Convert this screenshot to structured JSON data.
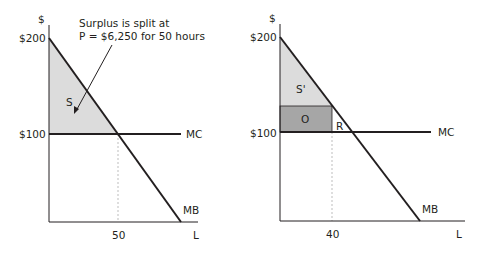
{
  "colors": {
    "axis": "#231f20",
    "curve": "#231f20",
    "light_fill": "#dcdcdc",
    "dark_fill": "#a6a6a6",
    "guide": "#bdbdbd"
  },
  "left_panel": {
    "y_axis_label": "$",
    "y_ticks": [
      "$200",
      "$100"
    ],
    "x_tick": "50",
    "x_axis_label": "L",
    "mc_label": "MC",
    "mb_label": "MB",
    "region_label": "S",
    "annotation_line1": "Surplus is split at",
    "annotation_line2": "P = $6,250 for 50 hours"
  },
  "right_panel": {
    "y_axis_label": "$",
    "y_ticks": [
      "$200",
      "$100"
    ],
    "x_tick": "40",
    "x_axis_label": "L",
    "mc_label": "MC",
    "mb_label": "MB",
    "region_labels": [
      "S'",
      "O",
      "R"
    ]
  }
}
